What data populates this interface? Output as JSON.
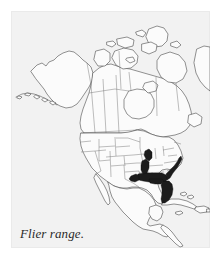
{
  "figure": {
    "caption": "Flier range.",
    "panel_background": "#f2f2f2",
    "page_background": "#ffffff"
  },
  "map": {
    "title": "North America",
    "projection_note": "North America with United States, Canada, Mexico, Central America and Caribbean",
    "land_fill": "#fbfbfb",
    "outline_color": "#4a4a4a",
    "border_color": "#6e6e6e",
    "range_fill": "#1c1c1c",
    "range_label": "Flier range",
    "range_regions": [
      "Florida",
      "Georgia coastal plain",
      "South Carolina coastal plain",
      "North Carolina coastal plain",
      "southeastern Virginia",
      "Alabama Gulf coast",
      "Mississippi Gulf coast",
      "Louisiana",
      "east Texas Gulf coast",
      "lower Mississippi Valley",
      "western Tennessee",
      "southeastern Missouri",
      "southern Illinois",
      "southern Indiana"
    ],
    "labeled_features": []
  }
}
